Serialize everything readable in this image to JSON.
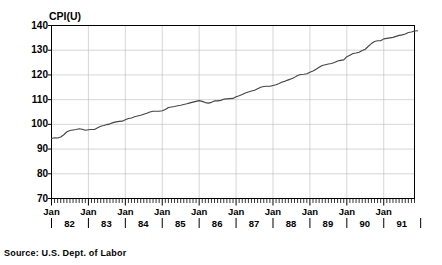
{
  "chart_data": {
    "type": "line",
    "title": "CPI(U)",
    "xlabel": "Year",
    "ylabel": "CPI(U)",
    "ylim": [
      70,
      140
    ],
    "yticks": [
      70,
      80,
      90,
      100,
      110,
      120,
      130,
      140
    ],
    "grid": true,
    "legend": null,
    "source": "Source: U.S. Dept. of Labor",
    "x_tick_unit": "month",
    "x_major_label": "Jan",
    "years": [
      "82",
      "83",
      "84",
      "85",
      "86",
      "87",
      "88",
      "89",
      "90",
      "91"
    ],
    "xlim_years": [
      1982,
      1991.75
    ],
    "series": [
      {
        "name": "CPI(U)",
        "color": "#000000",
        "x_start": "Jan 1982",
        "x_step": "monthly",
        "values": [
          94.3,
          94.6,
          94.5,
          94.9,
          95.8,
          97.0,
          97.5,
          97.7,
          97.9,
          98.2,
          98.0,
          97.6,
          97.8,
          97.9,
          97.9,
          98.6,
          99.2,
          99.5,
          99.9,
          100.2,
          100.7,
          101.0,
          101.2,
          101.3,
          101.9,
          102.4,
          102.6,
          103.1,
          103.4,
          103.7,
          104.1,
          104.5,
          105.0,
          105.3,
          105.3,
          105.3,
          105.5,
          106.0,
          106.8,
          107.0,
          107.2,
          107.5,
          107.7,
          108.0,
          108.3,
          108.7,
          109.0,
          109.3,
          109.6,
          109.3,
          108.8,
          108.6,
          108.9,
          109.5,
          109.5,
          109.7,
          110.2,
          110.3,
          110.4,
          110.5,
          111.2,
          111.6,
          112.1,
          112.7,
          113.1,
          113.5,
          113.8,
          114.4,
          115.0,
          115.3,
          115.4,
          115.4,
          115.7,
          116.0,
          116.5,
          117.1,
          117.5,
          118.0,
          118.5,
          119.0,
          119.8,
          120.2,
          120.3,
          120.5,
          121.1,
          121.6,
          122.3,
          123.1,
          123.8,
          124.1,
          124.4,
          124.6,
          125.0,
          125.6,
          125.9,
          126.1,
          127.4,
          128.0,
          128.7,
          128.9,
          129.2,
          129.9,
          130.4,
          131.6,
          132.7,
          133.5,
          133.8,
          133.8,
          134.6,
          134.8,
          135.0,
          135.2,
          135.6,
          136.0,
          136.2,
          136.6,
          137.2,
          137.4,
          137.8,
          137.9
        ]
      }
    ]
  },
  "labels": {
    "y_axis_title": "CPI(U)",
    "x_axis_title": "Year",
    "source_note": "Source: U.S. Dept. of Labor",
    "jan": "Jan"
  },
  "colors": {
    "line": "#444444",
    "axis": "#000000",
    "grid": "#bbbbbb",
    "background": "#ffffff"
  }
}
